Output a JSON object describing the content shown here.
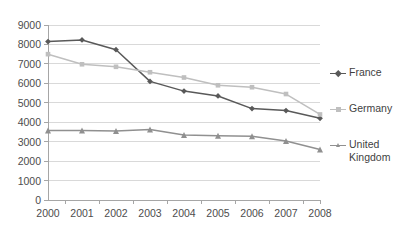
{
  "chart_data": {
    "type": "line",
    "title": "",
    "xlabel": "",
    "ylabel": "",
    "categories": [
      "2000",
      "2001",
      "2002",
      "2003",
      "2004",
      "2005",
      "2006",
      "2007",
      "2008"
    ],
    "x": [
      2000,
      2001,
      2002,
      2003,
      2004,
      2005,
      2006,
      2007,
      2008
    ],
    "ylim": [
      0,
      9000
    ],
    "yticks": [
      0,
      1000,
      2000,
      3000,
      4000,
      5000,
      6000,
      7000,
      8000,
      9000
    ],
    "ytick_labels": [
      "0",
      "1000",
      "2000",
      "3000",
      "4000",
      "5000",
      "6000",
      "7000",
      "8000",
      "9000"
    ],
    "grid": "horizontal",
    "legend_position": "right",
    "series": [
      {
        "name": "France",
        "color": "#595959",
        "marker": "diamond",
        "values": [
          8150,
          8230,
          7730,
          6100,
          5600,
          5350,
          4700,
          4600,
          4200
        ]
      },
      {
        "name": "Germany",
        "color": "#bfbfbf",
        "marker": "square",
        "values": [
          7500,
          6980,
          6850,
          6570,
          6300,
          5900,
          5800,
          5450,
          4400
        ]
      },
      {
        "name": "United Kingdom",
        "color": "#909090",
        "marker": "triangle",
        "values": [
          3570,
          3580,
          3550,
          3620,
          3340,
          3300,
          3280,
          3030,
          2600
        ]
      }
    ]
  },
  "legend": {
    "entries": [
      {
        "label": "France"
      },
      {
        "label": "Germany"
      },
      {
        "label": "United\nKingdom"
      }
    ]
  },
  "axes": {
    "gridline_color": "#d9d9d9",
    "axis_color": "#a6a6a6",
    "tick_text_color": "#4d4d4d"
  }
}
